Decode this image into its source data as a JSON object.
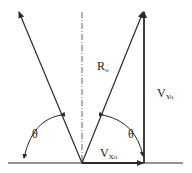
{
  "diagram": {
    "labels": {
      "resultant": "R",
      "resultant_sub": "o",
      "vertical": "V",
      "vertical_sub": "Yo",
      "horizontal": "V",
      "horizontal_sub": "Xo",
      "angle_left": "θ",
      "angle_right": "θ"
    },
    "colors": {
      "line": "#2a2a2a",
      "dashed": "#555555",
      "background": "#ffffff"
    }
  }
}
